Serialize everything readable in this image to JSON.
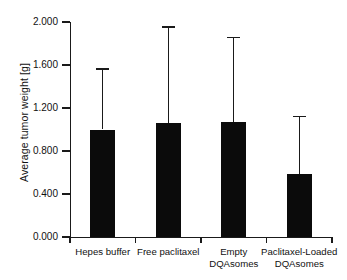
{
  "chart_data": {
    "type": "bar",
    "title": "",
    "xlabel": "",
    "ylabel": "Average tumor weight [g]",
    "categories": [
      "Hepes buffer",
      "Free paclitaxel",
      "Empty DQAsomes",
      "Paclitaxel-Loaded DQAsomes"
    ],
    "category_lines": [
      [
        "Hepes buffer",
        ""
      ],
      [
        "Free paclitaxel",
        ""
      ],
      [
        "Empty",
        "DQAsomes"
      ],
      [
        "Paclitaxel-Loaded",
        "DQAsomes"
      ]
    ],
    "values": [
      1.0,
      1.06,
      1.07,
      0.59
    ],
    "error_upper": [
      1.57,
      1.96,
      1.86,
      1.13
    ],
    "error_bars": "upper-only",
    "ylim": [
      0.0,
      2.0
    ],
    "yticks": [
      0.0,
      0.4,
      0.8,
      1.2,
      1.6,
      2.0
    ],
    "ytick_labels": [
      "0.000",
      "0.400",
      "0.800",
      "1.200",
      "1.600",
      "2.000"
    ],
    "grid": false,
    "legend": null,
    "bar_color": "#0b0b0b",
    "axis_color": "#1a1a1a",
    "background": "#ffffff"
  }
}
